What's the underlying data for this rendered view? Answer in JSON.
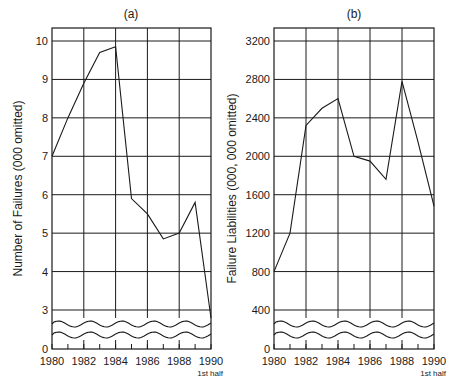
{
  "chart_data": [
    {
      "type": "line",
      "panel": "(a)",
      "title": "(a)",
      "xlabel": "",
      "ylabel": "Number of Failures (000 omitted)",
      "x": [
        1980,
        1981,
        1982,
        1983,
        1984,
        1985,
        1986,
        1987,
        1988,
        1989,
        1990
      ],
      "values": [
        7.0,
        8.0,
        8.9,
        9.7,
        9.85,
        5.9,
        5.5,
        4.85,
        5.0,
        5.8,
        2.7
      ],
      "x_ticks": [
        "1980",
        "1982",
        "1984",
        "1986",
        "1988",
        "1990"
      ],
      "x_tick_note": "1st half",
      "y_ticks": [
        "0",
        "3",
        "4",
        "5",
        "6",
        "7",
        "8",
        "9",
        "10"
      ],
      "ylim": [
        0,
        10.3
      ],
      "axis_break": "between 0 and 3",
      "grid": true
    },
    {
      "type": "line",
      "panel": "(b)",
      "title": "(b)",
      "xlabel": "",
      "ylabel": "Failure Liabilities (000, 000 omitted)",
      "x": [
        1980,
        1981,
        1982,
        1983,
        1984,
        1985,
        1986,
        1987,
        1988,
        1989,
        1990
      ],
      "values": [
        800,
        1200,
        2320,
        2500,
        2600,
        2000,
        1950,
        1760,
        2780,
        2150,
        1480
      ],
      "x_ticks": [
        "1980",
        "1982",
        "1984",
        "1986",
        "1988",
        "1990"
      ],
      "x_tick_note": "1st half",
      "y_ticks": [
        "0",
        "400",
        "800",
        "1200",
        "1600",
        "2000",
        "2400",
        "2800",
        "3200"
      ],
      "ylim": [
        0,
        3320
      ],
      "axis_break": "between 0 and 400",
      "grid": true
    }
  ]
}
